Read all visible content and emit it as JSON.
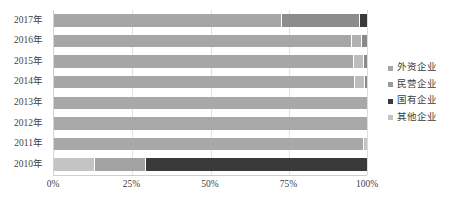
{
  "chart_data": {
    "type": "bar",
    "subtype": "horizontal-100-percent-stacked",
    "title": "",
    "xlabel": "",
    "ylabel": "",
    "xlim": [
      0,
      100
    ],
    "xticks": [
      "0%",
      "25%",
      "50%",
      "75%",
      "100%"
    ],
    "xtick_values": [
      0,
      25,
      50,
      75,
      100
    ],
    "grid": true,
    "grid_axis": "x",
    "legend_position": "right",
    "categories": [
      "2017年",
      "2016年",
      "2015年",
      "2014年",
      "2013年",
      "2012年",
      "2011年",
      "2010年"
    ],
    "category_order_top_to_bottom": [
      "2017年",
      "2016年",
      "2015年",
      "2014年",
      "2013年",
      "2012年",
      "2011年",
      "2010年"
    ],
    "series": [
      {
        "name": "外资企业",
        "color": "#a6a6a6",
        "values": [
          73.0,
          95.5,
          96.0,
          96.5,
          100.0,
          100.0,
          99.0,
          0.0
        ]
      },
      {
        "name": "民营企业",
        "color": "#8c8c8c",
        "values": [
          24.7,
          3.0,
          3.0,
          3.0,
          0.0,
          0.0,
          0.0,
          16.0
        ]
      },
      {
        "name": "国有企业",
        "color": "#3a3a3a",
        "values": [
          2.3,
          1.5,
          1.0,
          0.5,
          0.0,
          0.0,
          0.0,
          71.0
        ]
      },
      {
        "name": "其他企业",
        "color": "#c4c4c4",
        "values": [
          0.0,
          0.0,
          0.0,
          0.0,
          0.0,
          0.0,
          1.0,
          13.0
        ]
      }
    ],
    "stack_order": [
      "外资企业",
      "民营企业",
      "国有企业",
      "其他企业"
    ],
    "rows": [
      {
        "category": "2017年",
        "segments": [
          {
            "series": "外资企业",
            "value": 73.0,
            "color": "#a6a6a6"
          },
          {
            "series": "民营企业",
            "value": 24.7,
            "color": "#8c8c8c"
          },
          {
            "series": "国有企业",
            "value": 2.3,
            "color": "#3a3a3a"
          }
        ]
      },
      {
        "category": "2016年",
        "segments": [
          {
            "series": "外资企业",
            "value": 95.5,
            "color": "#a6a6a6"
          },
          {
            "series": "民营企业",
            "value": 3.0,
            "color": "#b0b0b0"
          },
          {
            "series": "国有企业",
            "value": 1.5,
            "color": "#8a8a8a"
          }
        ]
      },
      {
        "category": "2015年",
        "segments": [
          {
            "series": "外资企业",
            "value": 96.0,
            "color": "#a6a6a6"
          },
          {
            "series": "民营企业",
            "value": 3.0,
            "color": "#bdbdbd"
          },
          {
            "series": "国有企业",
            "value": 1.0,
            "color": "#8a8a8a"
          }
        ]
      },
      {
        "category": "2014年",
        "segments": [
          {
            "series": "外资企业",
            "value": 96.5,
            "color": "#a6a6a6"
          },
          {
            "series": "民营企业",
            "value": 3.0,
            "color": "#bdbdbd"
          },
          {
            "series": "国有企业",
            "value": 0.5,
            "color": "#8a8a8a"
          }
        ]
      },
      {
        "category": "2013年",
        "segments": [
          {
            "series": "外资企业",
            "value": 100.0,
            "color": "#a8a8a8"
          }
        ]
      },
      {
        "category": "2012年",
        "segments": [
          {
            "series": "外资企业",
            "value": 100.0,
            "color": "#a8a8a8"
          }
        ]
      },
      {
        "category": "2011年",
        "segments": [
          {
            "series": "外资企业",
            "value": 99.0,
            "color": "#a8a8a8"
          },
          {
            "series": "其他企业",
            "value": 1.0,
            "color": "#c4c4c4"
          }
        ]
      },
      {
        "category": "2010年",
        "segments": [
          {
            "series": "其他企业",
            "value": 13.0,
            "color": "#c4c4c4"
          },
          {
            "series": "民营企业",
            "value": 16.0,
            "color": "#a2a2a2"
          },
          {
            "series": "国有企业",
            "value": 71.0,
            "color": "#3a3a3a"
          }
        ]
      }
    ]
  },
  "legend": {
    "items": [
      {
        "label": "外资企业",
        "color": "#a6a6a6"
      },
      {
        "label": "民营企业",
        "color": "#9a9a9a"
      },
      {
        "label": "国有企业",
        "color": "#3a3a3a"
      },
      {
        "label": "其他企业",
        "color": "#c4c4c4"
      }
    ]
  },
  "axes": {
    "x_ticks": [
      {
        "label": "0%",
        "value": 0
      },
      {
        "label": "25%",
        "value": 25
      },
      {
        "label": "50%",
        "value": 50
      },
      {
        "label": "75%",
        "value": 75
      },
      {
        "label": "100%",
        "value": 100
      }
    ],
    "y_ticks": [
      {
        "label": "2017年"
      },
      {
        "label": "2016年"
      },
      {
        "label": "2015年"
      },
      {
        "label": "2014年"
      },
      {
        "label": "2013年"
      },
      {
        "label": "2012年"
      },
      {
        "label": "2011年"
      },
      {
        "label": "2010年"
      }
    ]
  },
  "colors": {
    "background": "#ffffff",
    "gridline": "#e3e3e3",
    "axis_line": "#cfcfcf",
    "text": "#3f3f3f"
  }
}
